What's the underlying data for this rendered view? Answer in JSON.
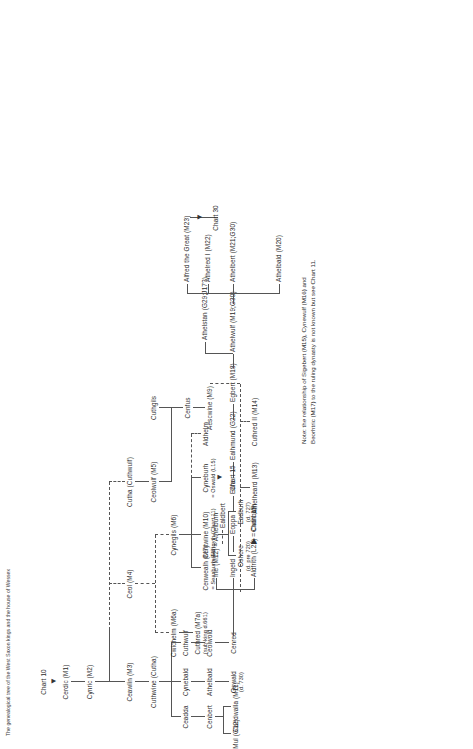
{
  "chart": {
    "heading": "The genealogical tree of the West Saxon kings and the house of Wessex",
    "title_node": "Chart 10",
    "note": "Note: the relationship of Sigebert (M15), Cynewulf (M16) and\nBeorhtric (M17) to the ruling dynasty is not known but see Chart 11.",
    "refs": {
      "chart15_a": "Chart 15",
      "chart15_b": "Chart 15",
      "chart30": "Chart 30"
    },
    "line_color": "#555555",
    "text_color": "#2b2b2b"
  },
  "people": {
    "cerdic": {
      "name": "Cerdic (M1)"
    },
    "cynric": {
      "name": "Cynric (M2)"
    },
    "ceawlin": {
      "name": "Ceawlin (M3)"
    },
    "ceol": {
      "name": "Ceol (M4)"
    },
    "cutha": {
      "name": "Cutha (Cuthwulf)"
    },
    "ceolwulf": {
      "name": "Ceolwulf (M5)"
    },
    "cuthwine": {
      "name": "Cuthwine (Cutha)"
    },
    "cwichelm": {
      "name": "Cwichelm (M6a)"
    },
    "cynegils": {
      "name": "Cynegils (M6)"
    },
    "cuthgils": {
      "name": "Cuthgils"
    },
    "cenfus": {
      "name": "Cenfus"
    },
    "aescwine": {
      "name": "Aescwine (M9)"
    },
    "cuthred_m7a": {
      "name": "Cuthred (M7a)",
      "detail": "(sub-king d.661)"
    },
    "cenwealh": {
      "name": "Cenwealh (M7)",
      "detail": "= Seaxburh (M8)"
    },
    "centwine": {
      "name": "Centwine (M10)",
      "detail": "= Eangyth (Chart 11)"
    },
    "cyneburh": {
      "name": "Cyneburh",
      "detail": "= Oswald (L15)"
    },
    "aldhelm": {
      "name": "Aldhelm"
    },
    "oshere": {
      "name": "Oshere",
      "detail": "(d. pre 720)"
    },
    "eadburh": {
      "name": "Eadburh",
      "detail": "(d. 727)"
    },
    "athelheard": {
      "name": "Athelheard (M13)"
    },
    "cuthred_ii": {
      "name": "Cuthred II (M14)"
    },
    "ceadda": {
      "name": "Ceadda"
    },
    "cynebald": {
      "name": "Cynebald"
    },
    "cuthwulf": {
      "name": "Cuthwulf"
    },
    "cenbert": {
      "name": "Cenbert"
    },
    "athelbald": {
      "name": "Athelbald"
    },
    "ceolwold": {
      "name": "Ceolwold"
    },
    "caedwalla": {
      "name": "Caedwalla (M11)"
    },
    "mul": {
      "name": "Mul (G12)"
    },
    "oswald": {
      "name": "Oswald",
      "detail": "(d. 730)"
    },
    "cenred": {
      "name": "Cenred"
    },
    "aldfrith": {
      "name": "Aldfrith (L22) = Cuthburh"
    },
    "ingeld": {
      "name": "Ingeld"
    },
    "ine": {
      "name": "Ine (M12) = Athelburh"
    },
    "ealdbert": {
      "name": "Ealdbert"
    },
    "eoppa": {
      "name": "Eoppa"
    },
    "eafa": {
      "name": "Eafa"
    },
    "ealhmund": {
      "name": "Ealhmund (G22)"
    },
    "egbert": {
      "name": "Egbert (M18)"
    },
    "athelwulf": {
      "name": "Athelwulf (M19;G30)"
    },
    "athelstan": {
      "name": "Athelstan (G29;J17?)"
    },
    "athelbald_m20": {
      "name": "Athelbald (M20)"
    },
    "athelbert": {
      "name": "Athelbert (M21;G30)"
    },
    "athelred_i": {
      "name": "Athelred I (M22)"
    },
    "alfred": {
      "name": "Alfred the Great (M23)"
    }
  }
}
